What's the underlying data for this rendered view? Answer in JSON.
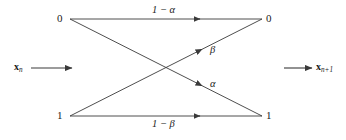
{
  "figure": {
    "name": "binary-channel-transition-diagram",
    "width": 346,
    "height": 140,
    "background_color": "#ffffff",
    "line_color": "#3a3a3a",
    "text_color": "#1a1a1a"
  },
  "nodes": {
    "top_left": {
      "label": "0",
      "x": 60,
      "y": 19
    },
    "top_right": {
      "label": "0",
      "x": 269,
      "y": 19
    },
    "bottom_left": {
      "label": "1",
      "x": 60,
      "y": 116
    },
    "bottom_right": {
      "label": "1",
      "x": 269,
      "y": 116
    }
  },
  "edges": [
    {
      "id": "zero-to-zero",
      "label": "1 − α",
      "from": "top_left",
      "to": "top_right",
      "label_x": 166,
      "label_y": 10,
      "arrow_at_x": 200
    },
    {
      "id": "zero-to-one",
      "label": "α",
      "from": "top_left",
      "to": "bottom_right",
      "label_x": 212,
      "label_y": 83,
      "arrow_at_x": 200
    },
    {
      "id": "one-to-zero",
      "label": "β",
      "from": "bottom_left",
      "to": "top_right",
      "label_x": 212,
      "label_y": 49,
      "arrow_at_x": 200
    },
    {
      "id": "one-to-one",
      "label": "1 − β",
      "from": "bottom_left",
      "to": "bottom_right",
      "label_x": 166,
      "label_y": 122,
      "arrow_at_x": 200
    }
  ],
  "io": {
    "input": {
      "symbol": "x",
      "subscript": "n",
      "label_x": 14,
      "label_y": 63,
      "arrow_from_x": 31,
      "arrow_to_x": 72,
      "arrow_y": 68
    },
    "output": {
      "symbol": "x",
      "subscript": "n+1",
      "label_x": 316,
      "label_y": 63,
      "arrow_from_x": 284,
      "arrow_to_x": 312,
      "arrow_y": 68
    }
  },
  "geometry": {
    "left_column_x": 70,
    "right_column_x": 262,
    "top_row_y": 19,
    "bottom_row_y": 116,
    "crossing_x": 166,
    "crossing_y": 68
  }
}
